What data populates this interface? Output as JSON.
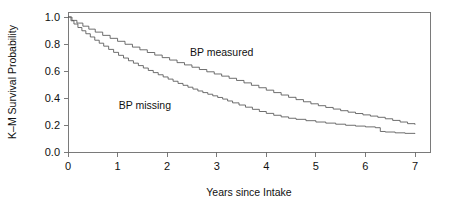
{
  "chart_data": {
    "type": "line",
    "title": "",
    "xlabel": "Years since Intake",
    "ylabel": "K–M Survival Probability",
    "xlim": [
      0,
      7.3
    ],
    "ylim": [
      0.0,
      1.0
    ],
    "grid": false,
    "legend_position": "inline-annotation",
    "xticks": [
      "0",
      "1",
      "2",
      "3",
      "4",
      "5",
      "6",
      "7"
    ],
    "xtick_values": [
      0,
      1,
      2,
      3,
      4,
      5,
      6,
      7
    ],
    "yticks": [
      "0.0",
      "0.2",
      "0.4",
      "0.6",
      "0.8",
      "1.0"
    ],
    "ytick_values": [
      0.0,
      0.2,
      0.4,
      0.6,
      0.8,
      1.0
    ],
    "series": [
      {
        "name": "BP measured",
        "annotation": "BP measured",
        "annotation_x": 3.1,
        "annotation_y": 0.74,
        "color": "#555555",
        "x": [
          0.0,
          0.08,
          0.18,
          0.3,
          0.42,
          0.55,
          0.7,
          0.85,
          1.0,
          1.15,
          1.3,
          1.45,
          1.6,
          1.75,
          1.9,
          2.05,
          2.2,
          2.35,
          2.5,
          2.65,
          2.8,
          2.95,
          3.1,
          3.25,
          3.4,
          3.55,
          3.7,
          3.85,
          4.0,
          4.15,
          4.3,
          4.45,
          4.6,
          4.75,
          4.9,
          5.05,
          5.2,
          5.35,
          5.5,
          5.65,
          5.8,
          5.95,
          6.1,
          6.25,
          6.4,
          6.55,
          6.7,
          6.85,
          7.0
        ],
        "y": [
          1.0,
          0.975,
          0.955,
          0.932,
          0.91,
          0.888,
          0.864,
          0.842,
          0.82,
          0.798,
          0.777,
          0.757,
          0.737,
          0.718,
          0.699,
          0.681,
          0.662,
          0.645,
          0.628,
          0.611,
          0.594,
          0.578,
          0.562,
          0.546,
          0.53,
          0.512,
          0.494,
          0.476,
          0.458,
          0.44,
          0.422,
          0.405,
          0.388,
          0.372,
          0.357,
          0.343,
          0.33,
          0.318,
          0.306,
          0.295,
          0.285,
          0.275,
          0.266,
          0.257,
          0.246,
          0.234,
          0.222,
          0.21,
          0.202
        ]
      },
      {
        "name": "BP missing",
        "annotation": "BP missing",
        "annotation_x": 1.55,
        "annotation_y": 0.345,
        "color": "#555555",
        "x": [
          0.0,
          0.06,
          0.12,
          0.2,
          0.28,
          0.36,
          0.45,
          0.54,
          0.63,
          0.72,
          0.82,
          0.92,
          1.02,
          1.12,
          1.22,
          1.32,
          1.42,
          1.52,
          1.62,
          1.72,
          1.82,
          1.92,
          2.02,
          2.12,
          2.22,
          2.32,
          2.42,
          2.52,
          2.62,
          2.72,
          2.82,
          2.92,
          3.02,
          3.12,
          3.22,
          3.32,
          3.45,
          3.58,
          3.72,
          3.86,
          4.0,
          4.15,
          4.3,
          4.45,
          4.6,
          4.8,
          5.0,
          5.2,
          5.4,
          5.6,
          5.8,
          6.0,
          6.2,
          6.3,
          6.4,
          6.6,
          6.8,
          7.0
        ],
        "y": [
          1.0,
          0.972,
          0.948,
          0.922,
          0.898,
          0.876,
          0.852,
          0.828,
          0.806,
          0.784,
          0.76,
          0.738,
          0.716,
          0.696,
          0.676,
          0.658,
          0.64,
          0.622,
          0.604,
          0.588,
          0.572,
          0.556,
          0.54,
          0.524,
          0.508,
          0.494,
          0.48,
          0.466,
          0.452,
          0.44,
          0.428,
          0.416,
          0.404,
          0.392,
          0.378,
          0.364,
          0.348,
          0.332,
          0.316,
          0.3,
          0.286,
          0.272,
          0.26,
          0.25,
          0.242,
          0.232,
          0.222,
          0.214,
          0.206,
          0.198,
          0.192,
          0.186,
          0.18,
          0.152,
          0.148,
          0.142,
          0.138,
          0.135
        ]
      }
    ]
  }
}
